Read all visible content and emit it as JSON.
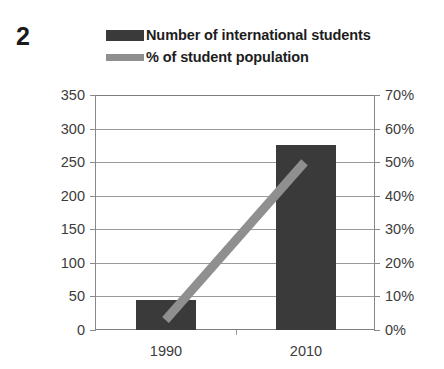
{
  "figure": {
    "number": "2"
  },
  "legend": {
    "position": "top",
    "items": [
      {
        "label": "Number of international students",
        "swatch": "bar-swatch",
        "color": "#3a3a3a"
      },
      {
        "label": "% of student population",
        "swatch": "line-swatch",
        "color": "#8f8f8f"
      }
    ]
  },
  "chart_data": {
    "type": "bar",
    "title": "",
    "xlabel": "",
    "ylabel": "",
    "categories": [
      "1990",
      "2010"
    ],
    "series": [
      {
        "name": "Number of international students",
        "type": "bar",
        "axis": "left",
        "color": "#3a3a3a",
        "values": [
          45,
          275
        ]
      },
      {
        "name": "% of student population",
        "type": "line",
        "axis": "right",
        "color": "#8f8f8f",
        "values": [
          3,
          50
        ]
      }
    ],
    "ylim": [
      0,
      350
    ],
    "y2lim": [
      0,
      70
    ],
    "yticks": [
      "0",
      "50",
      "100",
      "150",
      "200",
      "250",
      "300",
      "350"
    ],
    "ytick_values": [
      0,
      50,
      100,
      150,
      200,
      250,
      300,
      350
    ],
    "y2ticks": [
      "0%",
      "10%",
      "20%",
      "30%",
      "40%",
      "50%",
      "60%",
      "70%"
    ],
    "y2tick_values": [
      0,
      10,
      20,
      30,
      40,
      50,
      60,
      70
    ],
    "grid": true,
    "legend_position": "top"
  },
  "colors": {
    "bar": "#3a3a3a",
    "line": "#8f8f8f",
    "grid": "#9a9a9a",
    "axis": "#7d7d7d",
    "text": "#3c3c3c"
  }
}
